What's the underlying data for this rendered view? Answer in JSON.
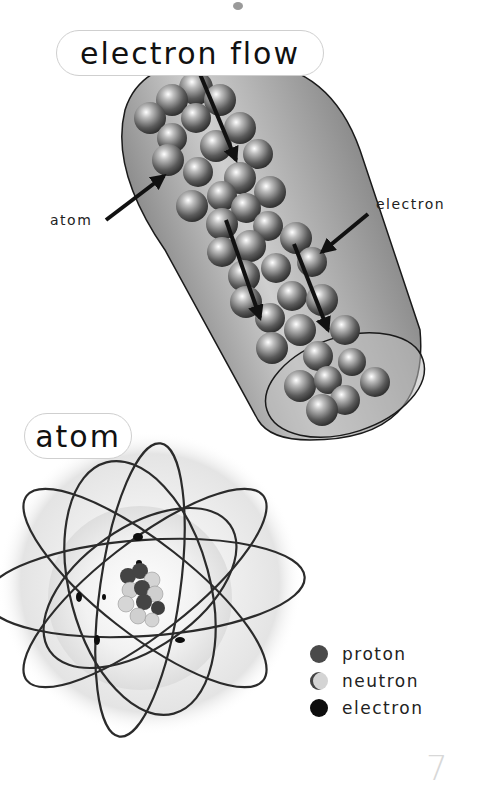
{
  "titles": {
    "electron_flow": "electron flow",
    "atom": "atom"
  },
  "wire_labels": {
    "atom": "atom",
    "electron": "electron"
  },
  "legend": [
    {
      "label": "proton",
      "color": "#4a4a4a"
    },
    {
      "label": "neutron",
      "color": "#d4d4d4"
    },
    {
      "label": "electron",
      "color": "#0d0d0d"
    }
  ],
  "page_number": "7"
}
